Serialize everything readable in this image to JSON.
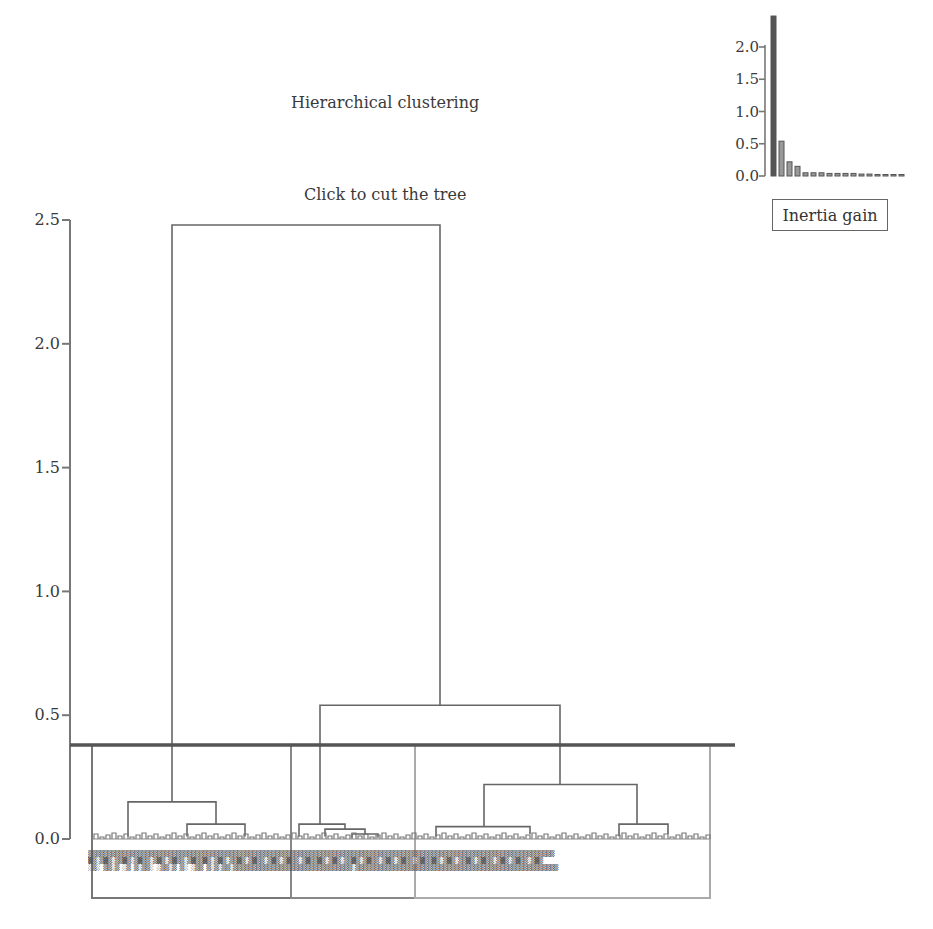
{
  "header": {
    "title": "Hierarchical clustering",
    "subtitle": "Click to cut the tree"
  },
  "controls": {
    "inertia_button": "Inertia gain"
  },
  "chart_data": [
    {
      "type": "dendrogram",
      "title": "Hierarchical clustering",
      "subtitle": "Click to cut the tree",
      "ylabel": "",
      "xlabel": "",
      "ylim": [
        0,
        2.5
      ],
      "yticks": [
        "0.0",
        "0.5",
        "1.0",
        "1.5",
        "2.0",
        "2.5"
      ],
      "cut_height": 0.38,
      "clusters": [
        {
          "name": "cluster-1",
          "x_start": 92,
          "x_end": 291,
          "color": "#777777"
        },
        {
          "name": "cluster-2",
          "x_start": 291,
          "x_end": 415,
          "color": "#888888"
        },
        {
          "name": "cluster-3",
          "x_start": 415,
          "x_end": 710,
          "color": "#aaaaaa"
        }
      ],
      "merges": [
        {
          "height": 2.48,
          "left_x": 172,
          "right_x": 440,
          "left_h": 0.38,
          "right_h": 0.54
        },
        {
          "height": 0.54,
          "left_x": 320,
          "right_x": 560,
          "left_h": 0.06,
          "right_h": 0.22
        },
        {
          "height": 0.15,
          "left_x": 128,
          "right_x": 216,
          "left_h": 0.01,
          "right_h": 0.06
        },
        {
          "height": 0.06,
          "left_x": 187,
          "right_x": 245,
          "left_h": 0.01,
          "right_h": 0.01
        },
        {
          "height": 0.22,
          "left_x": 484,
          "right_x": 637,
          "left_h": 0.05,
          "right_h": 0.06
        },
        {
          "height": 0.05,
          "left_x": 436,
          "right_x": 530,
          "left_h": 0.01,
          "right_h": 0.02
        },
        {
          "height": 0.06,
          "left_x": 619,
          "right_x": 668,
          "left_h": 0.01,
          "right_h": 0.02
        },
        {
          "height": 0.06,
          "left_x": 299,
          "right_x": 345,
          "left_h": 0.01,
          "right_h": 0.04
        },
        {
          "height": 0.04,
          "left_x": 325,
          "right_x": 365,
          "left_h": 0.01,
          "right_h": 0.02
        },
        {
          "height": 0.02,
          "left_x": 352,
          "right_x": 378,
          "left_h": 0.005,
          "right_h": 0.005
        }
      ]
    },
    {
      "type": "bar",
      "title": "Inertia gain",
      "ylim": [
        0,
        2.4
      ],
      "yticks": [
        "0.0",
        "0.5",
        "1.0",
        "1.5",
        "2.0"
      ],
      "categories": [
        "1",
        "2",
        "3",
        "4",
        "5",
        "6",
        "7",
        "8",
        "9",
        "10",
        "11",
        "12",
        "13",
        "14",
        "15",
        "16",
        "17"
      ],
      "values": [
        2.48,
        0.54,
        0.22,
        0.15,
        0.05,
        0.05,
        0.05,
        0.04,
        0.04,
        0.04,
        0.04,
        0.03,
        0.03,
        0.02,
        0.02,
        0.02,
        0.02
      ]
    }
  ]
}
